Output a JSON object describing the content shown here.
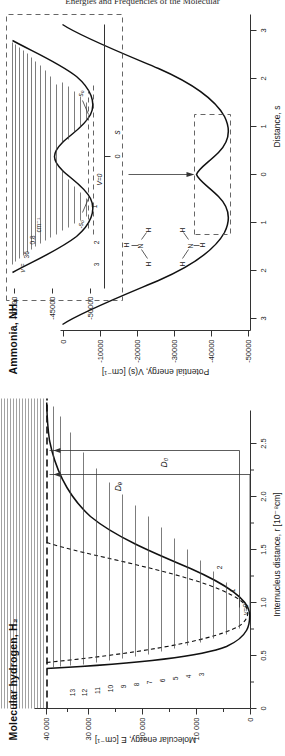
{
  "running_head": "Energies and Frequencies of the Molecular",
  "figure": {
    "orientation_note": "rotated",
    "panels": [
      {
        "id": "h2",
        "title": "Molecular hydrogen, H₂",
        "xlabel": "Internucleus distance, r  [10⁻⁸cm]",
        "ylabel": "Molecular energy, E  [cm⁻¹]",
        "xticks": [
          "0",
          "0.5",
          "1.0",
          "1.5",
          "2.0",
          "2.5"
        ],
        "yticks": [
          "0",
          "10 000",
          "20 000",
          "30 000",
          "40 000"
        ],
        "level_labels": [
          "v=0",
          "1",
          "2",
          "3",
          "4",
          "5",
          "6",
          "7",
          "8",
          "9",
          "10",
          "11",
          "12",
          "13"
        ],
        "annotations": [
          "D₀",
          "Dₑ"
        ]
      },
      {
        "id": "nh3",
        "title": "Ammonia, NH₃",
        "xlabel": "Distance, s",
        "ylabel": "Potential energy, V(s)  [cm⁻¹]",
        "xticks": [
          "3",
          "2",
          "1",
          "0",
          "1",
          "2",
          "3"
        ],
        "yticks": [
          "0",
          "-10000",
          "-20000",
          "-30000",
          "-40000",
          "-50000"
        ],
        "molecule_upper": {
          "n": "N",
          "h": [
            "H",
            "H",
            "H"
          ]
        },
        "molecule_lower": {
          "n": "N",
          "h": [
            "H",
            "H",
            "H"
          ]
        },
        "inset": {
          "xlabel": "s",
          "xticks": [
            "0"
          ],
          "yticks": [
            "-40000",
            "-45000",
            "-50000"
          ],
          "level_labels": [
            "V=0",
            "1",
            "2",
            "3"
          ],
          "markers": [
            "s₀",
            "-s₀"
          ],
          "nu_label": "ν =",
          "nu_value": "36",
          "gap_value": "0.8",
          "gap_unit": "cm⁻¹"
        }
      }
    ]
  }
}
